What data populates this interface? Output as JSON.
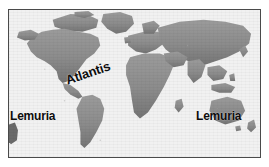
{
  "figure": {
    "type": "world-map-illustration",
    "width": 269,
    "height": 167,
    "background_color": "#ffffff",
    "frame": {
      "border_color": "#4a4a4a",
      "border_width_px": 1.5,
      "inset_left": 8,
      "inset_top": 9
    }
  },
  "map": {
    "projection_note": "equirectangular world map, grayscale",
    "ocean_color": "#f2f2f2",
    "land_color": "#8e8e8e",
    "land_shadow_color": "#6f6f6f",
    "land_highlight_color": "#a6a6a6",
    "continents": [
      "North America",
      "Greenland",
      "South America",
      "Europe",
      "Africa",
      "Asia",
      "Australia",
      "New Zealand",
      "Antarctic fragment"
    ]
  },
  "labels": [
    {
      "id": "lemuria-west",
      "text": "Lemuria",
      "color": "#0d0d0d",
      "rotation_deg": 0,
      "x": 10,
      "y": 110
    },
    {
      "id": "atlantis",
      "text": "Atlantis",
      "color": "#0d0d0d",
      "rotation_deg": -19,
      "x": 66,
      "y": 74
    },
    {
      "id": "lemuria-east",
      "text": "Lemuria",
      "color": "#0d0d0d",
      "rotation_deg": 0,
      "x": 196,
      "y": 110
    }
  ]
}
